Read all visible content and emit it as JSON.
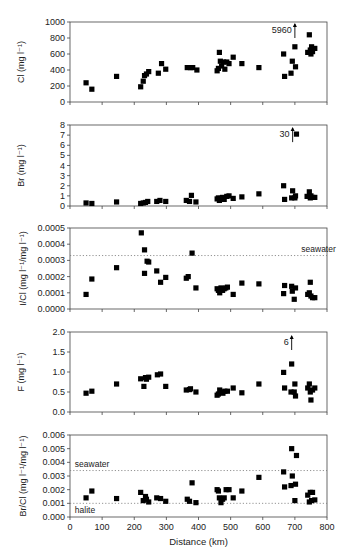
{
  "figure": {
    "xlabel": "Distance (km)",
    "x_ticks": [
      0,
      100,
      200,
      300,
      400,
      500,
      600,
      700,
      800
    ],
    "xlim": [
      0,
      800
    ]
  },
  "chart_data": [
    {
      "type": "scatter",
      "id": "cl",
      "ylabel": "Cl (mg l⁻¹)",
      "ylim": [
        0,
        1000
      ],
      "y_ticks": [
        0,
        200,
        400,
        600,
        800,
        1000
      ],
      "y_tick_labels": [
        "0",
        "200",
        "400",
        "600",
        "800",
        "1000"
      ],
      "annotations": [
        {
          "text": "5960",
          "x": 700,
          "y": 900,
          "arrow": true
        }
      ],
      "reference_lines": [],
      "points": [
        [
          50,
          240
        ],
        [
          68,
          160
        ],
        [
          145,
          320
        ],
        [
          220,
          190
        ],
        [
          228,
          260
        ],
        [
          232,
          330
        ],
        [
          238,
          350
        ],
        [
          245,
          380
        ],
        [
          275,
          360
        ],
        [
          285,
          480
        ],
        [
          298,
          410
        ],
        [
          365,
          430
        ],
        [
          375,
          430
        ],
        [
          382,
          430
        ],
        [
          395,
          400
        ],
        [
          458,
          390
        ],
        [
          462,
          420
        ],
        [
          465,
          620
        ],
        [
          468,
          510
        ],
        [
          472,
          450
        ],
        [
          478,
          500
        ],
        [
          482,
          410
        ],
        [
          488,
          500
        ],
        [
          495,
          480
        ],
        [
          508,
          560
        ],
        [
          535,
          480
        ],
        [
          588,
          430
        ],
        [
          665,
          600
        ],
        [
          668,
          320
        ],
        [
          688,
          360
        ],
        [
          692,
          510
        ],
        [
          700,
          690
        ],
        [
          702,
          440
        ],
        [
          740,
          620
        ],
        [
          745,
          840
        ],
        [
          748,
          650
        ],
        [
          750,
          600
        ],
        [
          752,
          690
        ],
        [
          755,
          630
        ],
        [
          762,
          670
        ]
      ]
    },
    {
      "type": "scatter",
      "id": "br",
      "ylabel": "Br (mg l⁻¹)",
      "ylim": [
        0,
        8
      ],
      "y_ticks": [
        0,
        1,
        2,
        3,
        4,
        5,
        6,
        7,
        8
      ],
      "y_tick_labels": [
        "0",
        "1",
        "2",
        "3",
        "4",
        "5",
        "6",
        "7",
        "8"
      ],
      "annotations": [
        {
          "text": "30",
          "x": 693,
          "y": 7.1,
          "arrow": true
        }
      ],
      "reference_lines": [],
      "points": [
        [
          50,
          0.3
        ],
        [
          68,
          0.25
        ],
        [
          145,
          0.4
        ],
        [
          220,
          0.25
        ],
        [
          228,
          0.3
        ],
        [
          235,
          0.35
        ],
        [
          242,
          0.45
        ],
        [
          270,
          0.45
        ],
        [
          280,
          0.55
        ],
        [
          298,
          0.45
        ],
        [
          362,
          0.55
        ],
        [
          372,
          0.45
        ],
        [
          378,
          1.05
        ],
        [
          392,
          0.4
        ],
        [
          458,
          0.7
        ],
        [
          462,
          0.8
        ],
        [
          465,
          0.55
        ],
        [
          470,
          0.75
        ],
        [
          475,
          0.85
        ],
        [
          480,
          0.65
        ],
        [
          488,
          0.95
        ],
        [
          495,
          1.0
        ],
        [
          508,
          0.75
        ],
        [
          535,
          0.9
        ],
        [
          588,
          1.2
        ],
        [
          665,
          2.0
        ],
        [
          668,
          0.65
        ],
        [
          690,
          0.8
        ],
        [
          693,
          1.5
        ],
        [
          700,
          0.8
        ],
        [
          702,
          1.0
        ],
        [
          705,
          7.1
        ],
        [
          738,
          0.95
        ],
        [
          745,
          1.4
        ],
        [
          748,
          0.8
        ],
        [
          750,
          1.0
        ],
        [
          755,
          0.85
        ],
        [
          762,
          0.85
        ]
      ]
    },
    {
      "type": "scatter",
      "id": "icl",
      "ylabel": "I/Cl  (mg l⁻¹/mg l⁻¹)",
      "ylim": [
        0,
        0.0005
      ],
      "y_ticks": [
        0,
        0.0001,
        0.0002,
        0.0003,
        0.0004,
        0.0005
      ],
      "y_tick_labels": [
        "0.0000",
        "0.0001",
        "0.0002",
        "0.0003",
        "0.0004",
        "0.0005"
      ],
      "annotations": [],
      "reference_lines": [
        {
          "label": "seawater",
          "y": 0.00033,
          "label_x": 720
        }
      ],
      "points": [
        [
          50,
          9e-05
        ],
        [
          68,
          0.000185
        ],
        [
          145,
          0.000255
        ],
        [
          222,
          0.00047
        ],
        [
          232,
          0.000365
        ],
        [
          232,
          0.00022
        ],
        [
          240,
          0.000295
        ],
        [
          245,
          0.00029
        ],
        [
          270,
          0.000235
        ],
        [
          282,
          0.000165
        ],
        [
          298,
          0.000195
        ],
        [
          362,
          0.00019
        ],
        [
          368,
          0.0002
        ],
        [
          380,
          0.000345
        ],
        [
          392,
          0.00013
        ],
        [
          458,
          0.000125
        ],
        [
          462,
          0.000115
        ],
        [
          466,
          0.0001
        ],
        [
          470,
          0.00013
        ],
        [
          475,
          0.000115
        ],
        [
          480,
          0.000125
        ],
        [
          485,
          0.00013
        ],
        [
          490,
          0.000135
        ],
        [
          508,
          9e-05
        ],
        [
          535,
          0.00016
        ],
        [
          588,
          0.000155
        ],
        [
          665,
          9.5e-05
        ],
        [
          668,
          0.000145
        ],
        [
          690,
          0.00014
        ],
        [
          692,
          0.00011
        ],
        [
          698,
          6e-05
        ],
        [
          702,
          0.00013
        ],
        [
          740,
          9e-05
        ],
        [
          745,
          0.0001
        ],
        [
          748,
          0.000165
        ],
        [
          750,
          8e-05
        ],
        [
          755,
          7e-05
        ],
        [
          762,
          7e-05
        ]
      ]
    },
    {
      "type": "scatter",
      "id": "f",
      "ylabel": "F (mg l⁻¹)",
      "ylim": [
        0,
        2.0
      ],
      "y_ticks": [
        0,
        0.5,
        1.0,
        1.5,
        2.0
      ],
      "y_tick_labels": [
        "0.0",
        "0.5",
        "1.0",
        "1.5",
        "2.0"
      ],
      "annotations": [
        {
          "text": "6",
          "x": 690,
          "y": 1.75,
          "arrow": true
        }
      ],
      "reference_lines": [],
      "points": [
        [
          50,
          0.47
        ],
        [
          68,
          0.52
        ],
        [
          145,
          0.7
        ],
        [
          220,
          0.83
        ],
        [
          230,
          0.64
        ],
        [
          235,
          0.86
        ],
        [
          238,
          0.82
        ],
        [
          245,
          0.87
        ],
        [
          272,
          0.93
        ],
        [
          282,
          0.95
        ],
        [
          298,
          0.64
        ],
        [
          362,
          0.55
        ],
        [
          372,
          0.56
        ],
        [
          375,
          0.58
        ],
        [
          392,
          0.5
        ],
        [
          458,
          0.42
        ],
        [
          462,
          0.45
        ],
        [
          466,
          0.55
        ],
        [
          470,
          0.5
        ],
        [
          476,
          0.47
        ],
        [
          482,
          0.52
        ],
        [
          490,
          0.52
        ],
        [
          508,
          0.6
        ],
        [
          535,
          0.48
        ],
        [
          588,
          0.7
        ],
        [
          665,
          0.99
        ],
        [
          668,
          0.6
        ],
        [
          690,
          1.2
        ],
        [
          688,
          0.5
        ],
        [
          698,
          0.5
        ],
        [
          700,
          0.7
        ],
        [
          702,
          0.4
        ],
        [
          740,
          0.6
        ],
        [
          745,
          0.7
        ],
        [
          748,
          0.5
        ],
        [
          750,
          0.3
        ],
        [
          755,
          0.55
        ],
        [
          762,
          0.6
        ]
      ]
    },
    {
      "type": "scatter",
      "id": "brcl",
      "ylabel": "Br/Cl (mg l⁻¹/mg l⁻¹)",
      "ylim": [
        0,
        0.006
      ],
      "y_ticks": [
        0,
        0.001,
        0.002,
        0.003,
        0.004,
        0.005,
        0.006
      ],
      "y_tick_labels": [
        "0.000",
        "0.001",
        "0.002",
        "0.003",
        "0.004",
        "0.005",
        "0.006"
      ],
      "annotations": [],
      "reference_lines": [
        {
          "label": "seawater",
          "y": 0.0034,
          "label_x": 15,
          "label_above": true
        },
        {
          "label": "halite",
          "y": 0.001,
          "label_x": 15,
          "label_above": false
        }
      ],
      "points": [
        [
          50,
          0.0014
        ],
        [
          68,
          0.0019
        ],
        [
          145,
          0.00135
        ],
        [
          220,
          0.0018
        ],
        [
          228,
          0.0012
        ],
        [
          235,
          0.0015
        ],
        [
          238,
          0.0013
        ],
        [
          245,
          0.0011
        ],
        [
          270,
          0.0014
        ],
        [
          282,
          0.00135
        ],
        [
          298,
          0.00115
        ],
        [
          365,
          0.0013
        ],
        [
          372,
          0.00115
        ],
        [
          380,
          0.0025
        ],
        [
          392,
          0.00105
        ],
        [
          458,
          0.002
        ],
        [
          462,
          0.0019
        ],
        [
          465,
          0.0014
        ],
        [
          470,
          0.00105
        ],
        [
          475,
          0.0013
        ],
        [
          480,
          0.0014
        ],
        [
          486,
          0.002
        ],
        [
          495,
          0.002
        ],
        [
          508,
          0.0014
        ],
        [
          535,
          0.0019
        ],
        [
          588,
          0.0029
        ],
        [
          665,
          0.0033
        ],
        [
          668,
          0.0022
        ],
        [
          688,
          0.0023
        ],
        [
          690,
          0.005
        ],
        [
          692,
          0.003
        ],
        [
          700,
          0.0012
        ],
        [
          702,
          0.0024
        ],
        [
          705,
          0.0045
        ],
        [
          740,
          0.0016
        ],
        [
          745,
          0.0011
        ],
        [
          748,
          0.0018
        ],
        [
          752,
          0.0012
        ],
        [
          755,
          0.0018
        ],
        [
          762,
          0.00125
        ]
      ]
    }
  ]
}
